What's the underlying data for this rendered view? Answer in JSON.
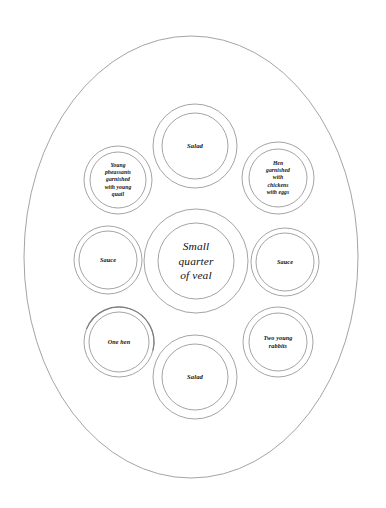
{
  "diagram": {
    "type": "oval table setting plan",
    "background_color": "#ffffff",
    "line_color": "#8d8d8d",
    "text_color": "#101010",
    "table": {
      "shape": "oval",
      "name": "oval-table-outline"
    },
    "dishes": [
      {
        "id": "salad-top",
        "name": "dish-salad-top",
        "label": "Salad",
        "position": "top-center",
        "size": "medium",
        "cx": 195,
        "cy": 146,
        "r_outer": 42,
        "r_inner": 33
      },
      {
        "id": "young-pheasants",
        "name": "dish-young-pheasants",
        "label": "Young\npheassants\ngarnished\nwith young\nquail",
        "position": "top-left",
        "size": "tiny",
        "cx": 118,
        "cy": 180,
        "r_outer": 34,
        "r_inner": 28
      },
      {
        "id": "hen-with-chickens",
        "name": "dish-hen-with-chickens",
        "label": "Hen\ngarnished\nwith\nchickens\nwith eggs",
        "position": "top-right",
        "size": "tiny",
        "cx": 278,
        "cy": 178,
        "r_outer": 36,
        "r_inner": 29
      },
      {
        "id": "sauce-left",
        "name": "dish-sauce-left",
        "label": "Sauce",
        "position": "middle-left",
        "size": "small",
        "cx": 108,
        "cy": 260,
        "r_outer": 34,
        "r_inner": 29
      },
      {
        "id": "small-quarter-of-veal",
        "name": "dish-small-quarter-of-veal",
        "label": "Small\nquarter\nof veal",
        "position": "center",
        "size": "large",
        "cx": 196,
        "cy": 261,
        "r_outer": 52,
        "r_inner": 38
      },
      {
        "id": "sauce-right",
        "name": "dish-sauce-right",
        "label": "Sauce",
        "position": "middle-right",
        "size": "small",
        "cx": 285,
        "cy": 262,
        "r_outer": 34,
        "r_inner": 29
      },
      {
        "id": "one-hen",
        "name": "dish-one-hen",
        "label": "One hen",
        "position": "bottom-left",
        "size": "small",
        "cx": 119,
        "cy": 342,
        "r_outer": 35,
        "r_inner": 30
      },
      {
        "id": "two-young-rabbits",
        "name": "dish-two-young-rabbits",
        "label": "Two young\nrabbits",
        "position": "bottom-right",
        "size": "small",
        "cx": 278,
        "cy": 342,
        "r_outer": 35,
        "r_inner": 29
      },
      {
        "id": "salad-bottom",
        "name": "dish-salad-bottom",
        "label": "Salad",
        "position": "bottom-center",
        "size": "medium",
        "cx": 195,
        "cy": 377,
        "r_outer": 42,
        "r_inner": 33
      }
    ]
  }
}
